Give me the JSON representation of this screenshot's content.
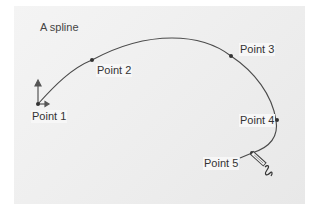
{
  "title": "A spline",
  "points": [
    {
      "label": "Point 1"
    },
    {
      "label": "Point 2"
    },
    {
      "label": "Point 3"
    },
    {
      "label": "Point 4"
    },
    {
      "label": "Point 5"
    }
  ],
  "colors": {
    "curve": "#444444",
    "point": "#333333",
    "background": "#eeeeee"
  },
  "icons": {
    "anchor": "direction-arrows-icon",
    "cursor": "pen-tool-cursor-icon"
  }
}
